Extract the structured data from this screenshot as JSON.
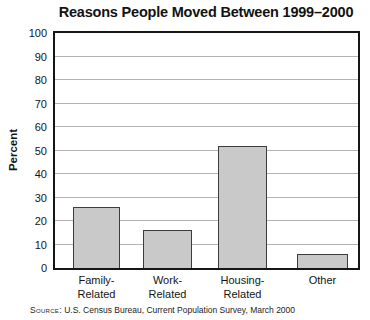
{
  "chart_data": {
    "type": "bar",
    "title": "Reasons People Moved Between 1999–2000",
    "categories": [
      "Family-Related",
      "Work-Related",
      "Housing-Related",
      "Other"
    ],
    "category_lines": [
      [
        "Family-",
        "Related"
      ],
      [
        "Work-",
        "Related"
      ],
      [
        "Housing-",
        "Related"
      ],
      [
        "Other"
      ]
    ],
    "values": [
      26,
      16,
      52,
      6
    ],
    "xlabel": "",
    "ylabel": "Percent",
    "ylim": [
      0,
      100
    ],
    "ytick_step": 10,
    "grid": true,
    "legend": "none",
    "source_prefix": "Source:",
    "source_text": " U.S. Census Bureau, Current Population Survey, March 2000",
    "colors": {
      "bar_fill": "#c9c9c9",
      "bar_border": "#3c3c3c",
      "gridline": "#b3b3b3",
      "axis_frame": "#161616",
      "text": "#141414"
    }
  }
}
